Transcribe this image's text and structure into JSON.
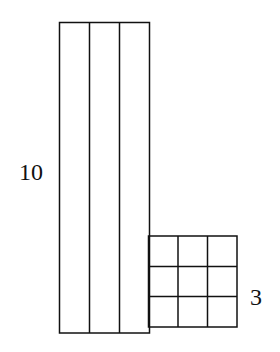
{
  "diagram": {
    "tall_block": {
      "label": "10",
      "columns": 3
    },
    "small_block": {
      "label": "3",
      "rows": 3,
      "columns": 3
    },
    "stroke_color": "#111111",
    "background": "#ffffff"
  }
}
